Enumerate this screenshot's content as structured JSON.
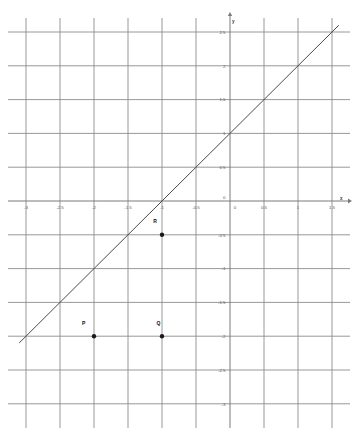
{
  "chart_data": {
    "type": "line",
    "title": "",
    "subtitle": "",
    "xlabel": "x",
    "ylabel": "y",
    "xlim": [
      -3.2,
      1.7
    ],
    "ylim": [
      -3.2,
      2.7
    ],
    "grid": true,
    "legend": false,
    "legend_position": "none",
    "x_ticks": [
      -3,
      -2.5,
      -2,
      -1.5,
      -1,
      -0.5,
      0,
      0.5,
      1,
      1.5
    ],
    "x_tick_labels": [
      "-3",
      "-2.5",
      "-2",
      "-1.5",
      "-1",
      "-0.5",
      "0",
      "0.5",
      "1",
      "1.5"
    ],
    "y_ticks": [
      2.5,
      2,
      1.5,
      1,
      0.5,
      0,
      -0.5,
      -1,
      -1.5,
      -2,
      -2.5,
      -3
    ],
    "y_tick_labels": [
      "2.5",
      "2",
      "1.5",
      "1",
      "0.5",
      "0",
      "-0.5",
      "-1",
      "-1.5",
      "-2",
      "-2.5",
      "-3"
    ],
    "origin_label": "0",
    "series": [
      {
        "name": "line",
        "type": "line",
        "slope": 1,
        "intercept": 1,
        "equation": "y = x + 1",
        "x": [
          -3.1,
          1.6
        ],
        "y": [
          -2.1,
          2.6
        ],
        "color": "#4a4a4a"
      }
    ],
    "annotations": [
      {
        "label": "P",
        "x": -2,
        "y": -2,
        "marker": "filled-circle",
        "label_dx": -0.1,
        "label_dy": 0.16
      },
      {
        "label": "Q",
        "x": -1,
        "y": -2,
        "marker": "filled-circle",
        "label_dx": 0.0,
        "label_dy": 0.16
      },
      {
        "label": "R",
        "x": -1,
        "y": -0.5,
        "marker": "filled-circle",
        "label_dx": -0.05,
        "label_dy": 0.17
      }
    ]
  },
  "axes": {
    "x_axis_name": "x",
    "y_axis_name": "y"
  },
  "colors": {
    "grid": "#8c8c8c",
    "axis": "#7a7a7a",
    "line": "#4a4a4a",
    "marker": "#1a1a1a",
    "tick_text": "#5a5a5a",
    "background": "#ffffff"
  }
}
